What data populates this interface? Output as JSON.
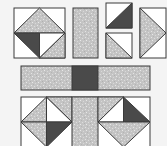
{
  "diagram": {
    "type": "quilt-block-assembly",
    "colors": {
      "background": "#f4f4f4",
      "white": "#ffffff",
      "print": "#c4c4c4",
      "print_speckle": "#e2e2e2",
      "dark": "#4a4a4a",
      "outline": "#3a3a3a"
    },
    "pieces": [
      {
        "id": "square-in-square-unit-top-left",
        "desc": "Square with print triangle top, dark and white half-square triangles bottom"
      },
      {
        "id": "vertical-sashing-strip",
        "desc": "Print rectangle strip"
      },
      {
        "id": "hst-dark",
        "desc": "Half-square triangle white/dark"
      },
      {
        "id": "hst-print",
        "desc": "Half-square triangle white/print"
      },
      {
        "id": "flying-geese-right",
        "desc": "Print triangle pointing right on white"
      },
      {
        "id": "horizontal-sashing-row",
        "desc": "Print strip with dark center square"
      },
      {
        "id": "assembled-bottom-row",
        "desc": "Two pinwheel-diamond units joined by print strip"
      }
    ]
  }
}
